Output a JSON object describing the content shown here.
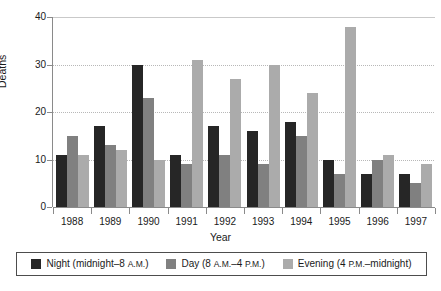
{
  "chart_data": {
    "type": "bar",
    "title": "",
    "xlabel": "Year",
    "ylabel": "Deaths",
    "categories": [
      "1988",
      "1989",
      "1990",
      "1991",
      "1992",
      "1993",
      "1994",
      "1995",
      "1996",
      "1997"
    ],
    "ylim": [
      0,
      40
    ],
    "yticks": [
      0,
      10,
      20,
      30,
      40
    ],
    "grid": true,
    "legend_position": "bottom",
    "series": [
      {
        "name": "Night (midnight–8 A.M.)",
        "color": "#262626",
        "values": [
          11,
          17,
          30,
          11,
          17,
          16,
          18,
          10,
          7,
          7
        ]
      },
      {
        "name": "Day (8 A.M.–4 P.M.)",
        "color": "#808080",
        "values": [
          15,
          13,
          23,
          9,
          11,
          9,
          15,
          7,
          10,
          5
        ]
      },
      {
        "name": "Evening (4 P.M.–midnight)",
        "color": "#ababab",
        "values": [
          11,
          12,
          10,
          31,
          27,
          30,
          24,
          38,
          11,
          9
        ]
      }
    ]
  },
  "axes": {
    "y_title": "Deaths",
    "x_title": "Year",
    "y_tick_labels": [
      "0",
      "10",
      "20",
      "30",
      "40"
    ],
    "x_tick_labels": [
      "1988",
      "1989",
      "1990",
      "1991",
      "1992",
      "1993",
      "1994",
      "1995",
      "1996",
      "1997"
    ]
  },
  "legend": {
    "items": [
      {
        "label_main": "Night (midnight–8 ",
        "label_small": "A.M.",
        "label_tail": ")",
        "swatch": "night-swatch"
      },
      {
        "label_main": "Day (8 ",
        "label_small": "A.M.",
        "label_mid": "–4 ",
        "label_small2": "P.M.",
        "label_tail": ")",
        "swatch": "day-swatch"
      },
      {
        "label_main": "Evening (4 ",
        "label_small": "P.M.",
        "label_tail": "–midnight)",
        "swatch": "evening-swatch"
      }
    ]
  },
  "colors": {
    "night": "#262626",
    "day": "#808080",
    "evening": "#ababab",
    "axis": "#8a8a8a",
    "grid": "#b8b8b8",
    "legend_border": "#4d4d4d",
    "background": "#ffffff"
  }
}
